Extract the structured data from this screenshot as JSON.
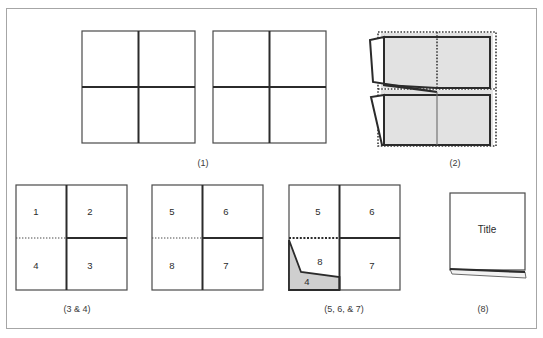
{
  "figure": {
    "border_color": "#a6a6a6",
    "background": "#ffffff",
    "line_color": "#3a3a3a",
    "heavy_line_color": "#2b2b2b",
    "shade_color": "#e2e2e2",
    "wedge_color": "#cfcfcf"
  },
  "panels": [
    {
      "id": "panel-1",
      "caption": "(1)",
      "caption_x": 203,
      "caption_y": 163,
      "description": "two unfolded quartered sheets",
      "shapes": [
        {
          "name": "sheet-left",
          "x": 82,
          "y": 31,
          "w": 113,
          "h": 112
        },
        {
          "name": "sheet-right",
          "x": 213,
          "y": 31,
          "w": 113,
          "h": 112
        }
      ]
    },
    {
      "id": "panel-2",
      "caption": "(2)",
      "caption_x": 455,
      "caption_y": 163,
      "description": "quartered sheet with shaded panels and two peeled left flaps",
      "shapes": [
        {
          "name": "sheet-folded",
          "x": 381,
          "y": 33,
          "w": 112,
          "h": 112
        }
      ]
    },
    {
      "id": "panel-3-4",
      "caption": "(3 & 4)",
      "caption_x": 77,
      "caption_y": 309,
      "description": "quartered sheet numbered 1 2 3 4 with dotted left crease",
      "labels": [
        {
          "name": "quadrant-label-1",
          "text": "1",
          "x": 36,
          "y": 212
        },
        {
          "name": "quadrant-label-2",
          "text": "2",
          "x": 90,
          "y": 212
        },
        {
          "name": "quadrant-label-4",
          "text": "4",
          "x": 36,
          "y": 266
        },
        {
          "name": "quadrant-label-3",
          "text": "3",
          "x": 90,
          "y": 266
        }
      ],
      "shapes": [
        {
          "name": "sheet",
          "x": 16,
          "y": 185,
          "w": 111,
          "h": 105
        }
      ]
    },
    {
      "id": "panel-5-6-7-8",
      "caption": "",
      "description": "quartered sheet numbered 5 6 7 8 with dotted left crease",
      "labels": [
        {
          "name": "quadrant-label-5",
          "text": "5",
          "x": 172,
          "y": 212
        },
        {
          "name": "quadrant-label-6",
          "text": "6",
          "x": 226,
          "y": 212
        },
        {
          "name": "quadrant-label-8",
          "text": "8",
          "x": 172,
          "y": 266
        },
        {
          "name": "quadrant-label-7",
          "text": "7",
          "x": 226,
          "y": 266
        }
      ],
      "shapes": [
        {
          "name": "sheet",
          "x": 152,
          "y": 185,
          "w": 111,
          "h": 105
        }
      ]
    },
    {
      "id": "panel-5-6-7",
      "caption": "(5, 6, & 7)",
      "caption_x": 344,
      "caption_y": 309,
      "description": "quartered sheet numbered 5 6 7 8 with shaded folded wedge numbered 4",
      "labels": [
        {
          "name": "quadrant-label-5",
          "text": "5",
          "x": 318,
          "y": 212
        },
        {
          "name": "quadrant-label-6",
          "text": "6",
          "x": 372,
          "y": 212
        },
        {
          "name": "quadrant-label-8",
          "text": "8",
          "x": 318,
          "y": 262
        },
        {
          "name": "quadrant-label-7",
          "text": "7",
          "x": 372,
          "y": 266
        },
        {
          "name": "wedge-label-4",
          "text": "4",
          "x": 305,
          "y": 282
        }
      ],
      "shapes": [
        {
          "name": "sheet",
          "x": 289,
          "y": 185,
          "w": 111,
          "h": 105
        }
      ]
    },
    {
      "id": "panel-8",
      "caption": "(8)",
      "caption_x": 483,
      "caption_y": 309,
      "description": "finished folded booklet showing the title panel with a thin flap",
      "labels": [
        {
          "name": "title-label",
          "text": "Title",
          "x": 482,
          "y": 230
        }
      ],
      "shapes": [
        {
          "name": "booklet",
          "x": 450,
          "y": 193,
          "w": 75,
          "h": 77
        }
      ]
    }
  ],
  "captions": {
    "panel_1": "(1)",
    "panel_2": "(2)",
    "panel_3_4": "(3 & 4)",
    "panel_5_6_7": "(5, 6, & 7)",
    "panel_8": "(8)"
  },
  "numbers": {
    "n1": "1",
    "n2": "2",
    "n3": "3",
    "n4": "4",
    "n5": "5",
    "n6": "6",
    "n7": "7",
    "n8": "8",
    "wedge": "4",
    "title": "Title"
  }
}
